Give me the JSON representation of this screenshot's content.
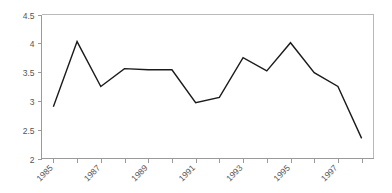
{
  "chart_data": {
    "type": "line",
    "title": "",
    "subtitle": "",
    "xlabel": "",
    "ylabel": "",
    "x": [
      1985,
      1986,
      1987,
      1988,
      1989,
      1990,
      1991,
      1992,
      1993,
      1994,
      1995,
      1996,
      1997,
      1998
    ],
    "series": [
      {
        "name": "series-1",
        "values": [
          2.9,
          4.03,
          3.25,
          3.56,
          3.54,
          3.54,
          2.97,
          3.06,
          3.75,
          3.52,
          4.01,
          3.49,
          3.25,
          2.35
        ],
        "color": "#1b1b1b"
      }
    ],
    "xlim": [
      1984.5,
      1998.5
    ],
    "ylim": [
      2,
      4.5
    ],
    "y_ticks": [
      2,
      2.5,
      3,
      3.5,
      4,
      4.5
    ],
    "y_tick_labels": [
      "2",
      "2.5",
      "3",
      "3.5",
      "4",
      "4.5"
    ],
    "x_ticks": [
      1985,
      1986,
      1987,
      1988,
      1989,
      1990,
      1991,
      1992,
      1993,
      1994,
      1995,
      1996,
      1997,
      1998
    ],
    "x_tick_labels": [
      "1985",
      "",
      "1987",
      "",
      "1989",
      "",
      "1991",
      "",
      "1993",
      "",
      "1995",
      "",
      "1997",
      ""
    ],
    "x_labeled_ticks": [
      {
        "value": 1985,
        "label": "1985"
      },
      {
        "value": 1987,
        "label": "1987"
      },
      {
        "value": 1989,
        "label": "1989"
      },
      {
        "value": 1991,
        "label": "1991"
      },
      {
        "value": 1993,
        "label": "1993"
      },
      {
        "value": 1995,
        "label": "1995"
      },
      {
        "value": 1997,
        "label": "1997"
      }
    ],
    "x_tick_label_rotation": -45,
    "grid": false,
    "legend": false,
    "legend_position": "none",
    "frame": {
      "top": true,
      "right": true,
      "bottom": true,
      "left": true,
      "plot_border_color": "#b9b9b9",
      "axis_color": "#9a9a9a"
    },
    "annotations": []
  }
}
